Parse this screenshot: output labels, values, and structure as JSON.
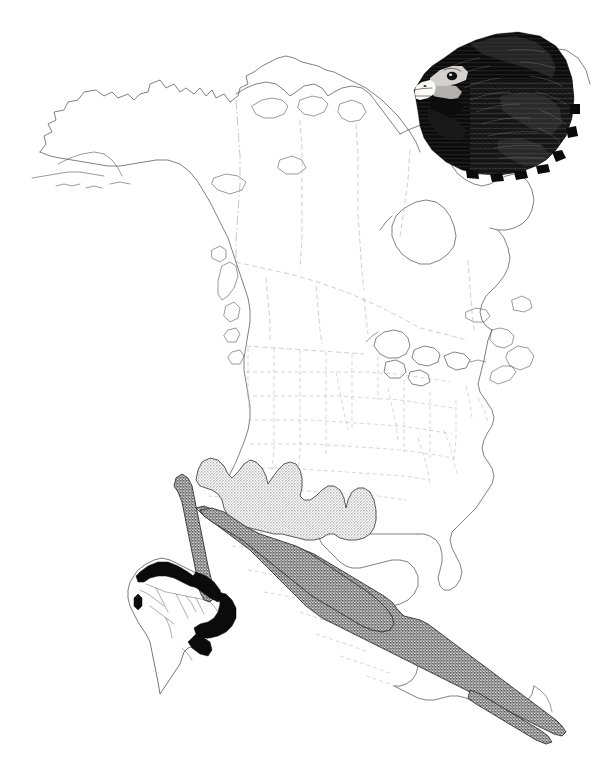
{
  "figure": {
    "kind": "species-range-map",
    "title": "",
    "caption": "",
    "background_color": "#ffffff",
    "width": 592,
    "height": 770
  },
  "legend": {
    "present": false,
    "entries": [
      {
        "key": "range-light",
        "label": "",
        "fill_description": "light stipple",
        "color": "#c9c9c9"
      },
      {
        "key": "range-dark",
        "label": "",
        "fill_description": "dark stipple",
        "color": "#8a8a8a"
      },
      {
        "key": "range-solid",
        "label": "",
        "fill_description": "solid black",
        "color": "#0b0b0b"
      }
    ]
  },
  "main_map": {
    "name": "north-and-central-america",
    "coastline_color": "#4a4a4a",
    "political_border_color": "#b9b4b4",
    "regions": [
      {
        "name": "northern-mexico-range",
        "shading": "light-stipple",
        "color": "#c9c9c9"
      },
      {
        "name": "southern-mexico-central-america-range",
        "shading": "dark-stipple",
        "color": "#8a8a8a"
      },
      {
        "name": "baja-california-range",
        "shading": "dark-stipple",
        "color": "#8a8a8a"
      }
    ],
    "labeled_features": []
  },
  "inset_map": {
    "name": "south-america-inset",
    "regions": [
      {
        "name": "northern-south-america-range",
        "shading": "solid-black",
        "color": "#0b0b0b"
      },
      {
        "name": "eastern-brazil-range",
        "shading": "solid-black",
        "color": "#0b0b0b"
      }
    ],
    "labeled_features": []
  },
  "illustration": {
    "name": "raptor-head",
    "description": "hawk head portrait, facing left",
    "position": "top-right",
    "colors": {
      "plumage": "#0a0a0a",
      "beak_base": "#e9e7e4",
      "beak_tip": "#111111"
    }
  },
  "annotations": {
    "text_items": []
  }
}
